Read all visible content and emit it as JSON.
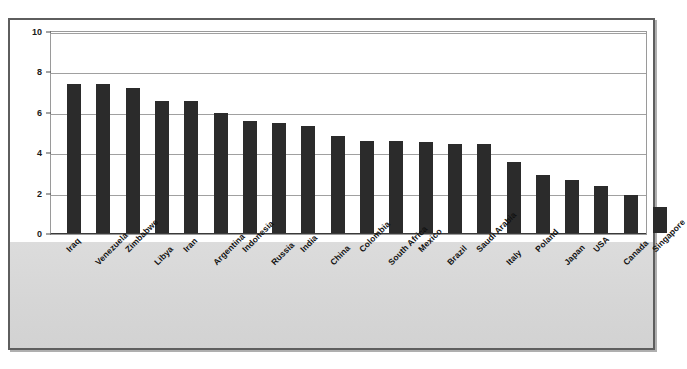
{
  "chart_data": {
    "type": "bar",
    "title": "",
    "xlabel": "",
    "ylabel": "",
    "ylim": [
      0,
      10
    ],
    "yticks": [
      0,
      2,
      4,
      6,
      8,
      10
    ],
    "grid": true,
    "legend": "none",
    "orientation": "vertical",
    "bar_color": "#2b2b2b",
    "categories": [
      "Iraq",
      "Venezuela",
      "Zimbabwe",
      "Libya",
      "Iran",
      "Argentina",
      "Indonesia",
      "Russia",
      "India",
      "China",
      "Colombia",
      "South Africa",
      "Mexico",
      "Brazil",
      "Saudi Arabia",
      "Italy",
      "Poland",
      "Japan",
      "USA",
      "Canada",
      "Singapore"
    ],
    "values": [
      7.4,
      7.4,
      7.2,
      6.55,
      6.55,
      5.95,
      5.55,
      5.45,
      5.3,
      4.8,
      4.55,
      4.55,
      4.5,
      4.4,
      4.4,
      3.5,
      2.85,
      2.6,
      2.35,
      1.9,
      1.3
    ]
  },
  "axis": {
    "y_tick_labels": [
      "10",
      "8",
      "6",
      "4",
      "2",
      "0"
    ]
  },
  "colors": {
    "bar": "#2b2b2b",
    "grid": "#a0a0a0",
    "frame": "#5e5e5e",
    "band": "#d9d9d9",
    "plot_background": "#ffffff"
  }
}
